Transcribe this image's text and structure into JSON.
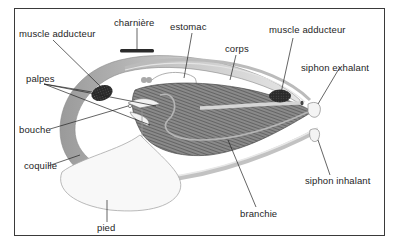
{
  "diagram": {
    "language": "fr",
    "labels": {
      "charniere": "charnière",
      "muscle_adducteur_anterior": "muscle adducteur",
      "estomac": "estomac",
      "corps": "corps",
      "muscle_adducteur_posterior": "muscle adducteur",
      "palpes": "palpes",
      "siphon_exhalant": "siphon exhalant",
      "bouche": "bouche",
      "coquille": "coquille",
      "siphon_inhalant": "siphon inhalant",
      "branchie": "branchie",
      "pied": "pied"
    },
    "colors": {
      "frame": "#3a3a3a",
      "shell": "#b8b8b8",
      "shell_inner": "#d9d9d9",
      "gill": "#6e6e6e",
      "muscle": "#2a2a2a",
      "foot": "#f7f7f7",
      "leader_line": "#222222"
    }
  }
}
